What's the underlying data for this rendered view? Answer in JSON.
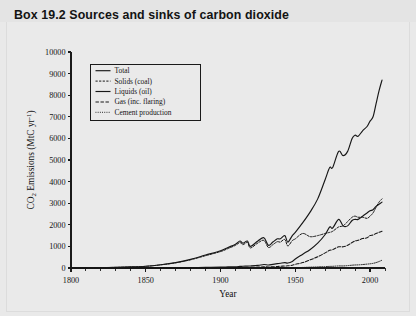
{
  "figure": {
    "title": "Box 19.2  Sources and sinks of carbon dioxide",
    "background_color": "#e9e9e9",
    "ink_color": "#171717"
  },
  "chart_data": {
    "type": "line",
    "title": "",
    "xlabel": "Year",
    "ylabel": "CO2 Emissions (MtC yr-1)",
    "ylabel_parts": {
      "lead": "CO",
      "sub": "2",
      "mid": " Emissions (MtC yr",
      "sup": "-1",
      "tail": ")"
    },
    "xlim": [
      1800,
      2010
    ],
    "ylim": [
      0,
      10000
    ],
    "grid": false,
    "legend_position": "upper-left-inside",
    "x_ticks_major": [
      1800,
      1850,
      1900,
      1950,
      2000
    ],
    "x_tick_labels": [
      "1800",
      "1850",
      "1900",
      "1950",
      "2000"
    ],
    "x_tick_minor_step": 10,
    "y_ticks": [
      0,
      1000,
      2000,
      3000,
      4000,
      5000,
      6000,
      7000,
      8000,
      9000,
      10000
    ],
    "y_tick_labels": [
      "0",
      "1000",
      "2000",
      "3000",
      "4000",
      "5000",
      "6000",
      "7000",
      "8000",
      "9000",
      "10000"
    ],
    "x": [
      1800,
      1810,
      1820,
      1830,
      1840,
      1850,
      1860,
      1870,
      1880,
      1890,
      1900,
      1905,
      1910,
      1913,
      1915,
      1918,
      1920,
      1925,
      1929,
      1932,
      1935,
      1938,
      1940,
      1943,
      1945,
      1948,
      1950,
      1955,
      1960,
      1965,
      1970,
      1973,
      1975,
      1979,
      1982,
      1985,
      1988,
      1990,
      1992,
      1995,
      1998,
      2000,
      2002,
      2004,
      2006,
      2008
    ],
    "series": [
      {
        "name": "Total",
        "style": "solid",
        "values": [
          10,
          15,
          20,
          30,
          50,
          80,
          150,
          250,
          400,
          600,
          800,
          950,
          1100,
          1250,
          1150,
          1250,
          1000,
          1250,
          1400,
          1050,
          1200,
          1350,
          1350,
          1500,
          1200,
          1500,
          1650,
          2100,
          2600,
          3200,
          4100,
          4650,
          4650,
          5400,
          5200,
          5400,
          6000,
          6150,
          6100,
          6350,
          6550,
          6800,
          7000,
          7600,
          8200,
          8700
        ]
      },
      {
        "name": "Solids (coal)",
        "style": "dashed",
        "values": [
          10,
          15,
          20,
          30,
          50,
          78,
          145,
          240,
          380,
          570,
          760,
          900,
          1050,
          1180,
          1080,
          1180,
          930,
          1160,
          1280,
          950,
          1080,
          1220,
          1200,
          1320,
          1020,
          1270,
          1350,
          1600,
          1450,
          1500,
          1600,
          1650,
          1700,
          1900,
          1950,
          2150,
          2350,
          2400,
          2350,
          2350,
          2300,
          2400,
          2550,
          2800,
          3050,
          3200
        ]
      },
      {
        "name": "Liquids (oil)",
        "style": "solid",
        "values": [
          0,
          0,
          0,
          0,
          0,
          2,
          5,
          10,
          20,
          30,
          40,
          50,
          60,
          75,
          80,
          90,
          95,
          120,
          160,
          140,
          170,
          200,
          220,
          250,
          230,
          300,
          420,
          640,
          860,
          1150,
          1550,
          1900,
          1850,
          2250,
          1950,
          1950,
          2200,
          2250,
          2250,
          2400,
          2550,
          2650,
          2700,
          2850,
          2950,
          3050
        ]
      },
      {
        "name": "Gas (inc. flaring)",
        "style": "dashed-long",
        "values": [
          0,
          0,
          0,
          0,
          0,
          0,
          0,
          0,
          2,
          5,
          10,
          14,
          18,
          22,
          24,
          28,
          30,
          40,
          55,
          50,
          58,
          70,
          80,
          95,
          100,
          130,
          170,
          250,
          380,
          520,
          700,
          820,
          850,
          980,
          980,
          1050,
          1180,
          1250,
          1280,
          1360,
          1400,
          1500,
          1530,
          1600,
          1650,
          1700
        ]
      },
      {
        "name": "Cement production",
        "style": "dotted",
        "values": [
          0,
          0,
          0,
          0,
          0,
          0,
          0,
          0,
          0,
          1,
          2,
          3,
          4,
          5,
          5,
          5,
          6,
          8,
          10,
          7,
          8,
          10,
          11,
          11,
          10,
          14,
          18,
          26,
          38,
          50,
          65,
          75,
          78,
          95,
          95,
          110,
          130,
          140,
          145,
          160,
          180,
          195,
          215,
          250,
          300,
          360
        ]
      }
    ],
    "legend_entries": [
      "Total",
      "Solids (coal)",
      "Liquids (oil)",
      "Gas (inc. flaring)",
      "Cement production"
    ]
  }
}
